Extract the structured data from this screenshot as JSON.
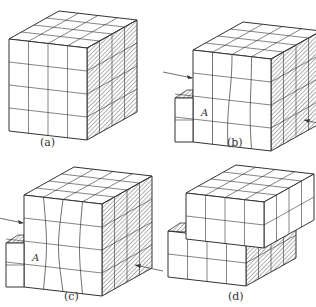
{
  "figure": {
    "panels": [
      {
        "id": "a",
        "caption": "(a)",
        "state": "undeformed cube",
        "caption_pos": [
          60,
          142
        ]
      },
      {
        "id": "b",
        "caption": "(b)",
        "state": "shear with curved grid lines, label A",
        "label": "A",
        "caption_pos": [
          226,
          142
        ]
      },
      {
        "id": "c",
        "caption": "(c)",
        "state": "shear with bulging grid lines, label A",
        "label": "A",
        "caption_pos": [
          60,
          294
        ]
      },
      {
        "id": "d",
        "caption": "(d)",
        "state": "upper block slid off lower block",
        "caption_pos": [
          226,
          294
        ]
      }
    ],
    "grid_divisions": 4,
    "colors": {
      "line": "#333333",
      "hatch": "#555555",
      "background": "#ffffff"
    }
  }
}
